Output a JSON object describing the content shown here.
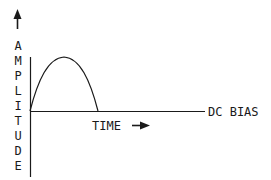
{
  "diagram": {
    "y_axis_label": "AMPLITUDE",
    "y_axis_letters": [
      "A",
      "M",
      "P",
      "L",
      "I",
      "T",
      "U",
      "D",
      "E"
    ],
    "x_axis_label": "TIME",
    "baseline_label": "DC BIAS",
    "icons": {
      "y_arrow": "arrow-up-icon",
      "x_arrow": "arrow-right-icon"
    },
    "colors": {
      "stroke": "#1a1a1a",
      "background": "#ffffff"
    },
    "curve": {
      "shape": "half-sine pulse above DC bias baseline",
      "start_x": 30,
      "peak_x": 64,
      "end_x": 98,
      "baseline_y": 111,
      "peak_y": 57
    }
  }
}
